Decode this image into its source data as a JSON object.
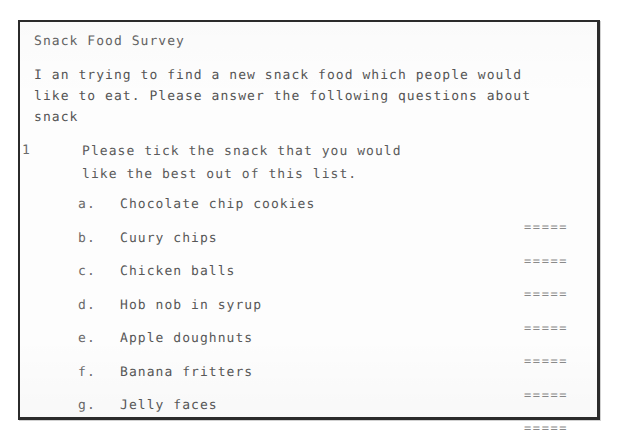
{
  "document": {
    "title": "Snack Food Survey",
    "intro_lines": [
      "I an trying to find a new snack food which people would",
      "like to eat. Please answer the following questions about",
      "snack"
    ],
    "questions": [
      {
        "number": "1",
        "text_lines": [
          "Please tick the snack that you would",
          "like the best out of this list."
        ],
        "options": [
          {
            "letter": "a.",
            "label": "Chocolate chip cookies",
            "answer_rule": "====="
          },
          {
            "letter": "b.",
            "label": "Cuury chips",
            "answer_rule": "====="
          },
          {
            "letter": "c.",
            "label": "Chicken balls",
            "answer_rule": "====="
          },
          {
            "letter": "d.",
            "label": "Hob nob in syrup",
            "answer_rule": "====="
          },
          {
            "letter": "e.",
            "label": "Apple doughnuts",
            "answer_rule": "====="
          },
          {
            "letter": "f.",
            "label": "Banana fritters",
            "answer_rule": "====="
          },
          {
            "letter": "g.",
            "label": "Jelly faces",
            "answer_rule": "====="
          }
        ]
      }
    ]
  },
  "colors": {
    "page_background": "#ffffff",
    "sheet_background": "#fdfdfd",
    "border": "#2b2b2b",
    "text": "#585858",
    "rule": "#8a8a8a"
  }
}
